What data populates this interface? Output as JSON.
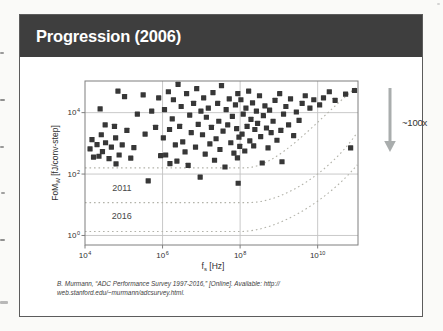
{
  "slide": {
    "title": "Progression (2006)",
    "citation": {
      "line1": "B. Murmann, “ADC Performance Survey 1997-2016,” [Online]. Available: http://",
      "line2": "web.stanford.edu/~murmann/adcsurvey.html."
    }
  },
  "colors": {
    "title_bar_bg": "#3e3e3e",
    "title_text": "#ffffff",
    "slide_border": "#5c5c5c",
    "plot_frame": "#7f7f7f",
    "gridline": "#c3c3c3",
    "scatter": "#373737",
    "trend_dotted": "#b3b3aa",
    "arrow": "#a9adad",
    "page_bg": "#fafaf8"
  },
  "chart_data": {
    "type": "scatter",
    "title": "",
    "xlabel": {
      "pre": "f",
      "sub": "s",
      "post": " [Hz]"
    },
    "ylabel": {
      "pre": "FoM",
      "sub": "W",
      "post": " [fJ/conv-step]"
    },
    "x_scale": "log",
    "y_scale": "log",
    "xlim_log10": [
      4,
      11.04
    ],
    "ylim_log10": [
      -0.31,
      5.03
    ],
    "x_tick_exponents": [
      4,
      6,
      8,
      10
    ],
    "y_tick_exponents": [
      0,
      2,
      4
    ],
    "grid": "light solid gridlines at labeled decades",
    "legend": "none",
    "arrow_label": "~100x",
    "trend_curves": [
      {
        "label": "",
        "year_implied": "2006 envelope",
        "fom_flat_log10": 2.2,
        "knee_fs_log10": 8.1,
        "c1": [
          9.0,
          2.2
        ],
        "c2": [
          10.0,
          3.8
        ],
        "end": [
          11.02,
          4.85
        ]
      },
      {
        "label": "2011",
        "fom_flat_log10": 1.07,
        "knee_fs_log10": 8.2,
        "c1": [
          9.2,
          1.07
        ],
        "c2": [
          10.4,
          2.2
        ],
        "end": [
          11.02,
          3.35
        ],
        "label_at": [
          4.95,
          1.33
        ]
      },
      {
        "label": "2016",
        "fom_flat_log10": 0.13,
        "knee_fs_log10": 8.0,
        "c1": [
          9.0,
          0.13
        ],
        "c2": [
          10.3,
          1.2
        ],
        "end": [
          11.02,
          2.3
        ],
        "label_at": [
          4.95,
          0.42
        ]
      }
    ],
    "points_log10": [
      [
        4.13,
        2.82
      ],
      [
        4.18,
        3.12
      ],
      [
        4.22,
        2.55
      ],
      [
        4.31,
        2.96
      ],
      [
        4.36,
        2.58
      ],
      [
        4.42,
        3.28
      ],
      [
        4.45,
        2.73
      ],
      [
        4.53,
        3.02
      ],
      [
        4.62,
        2.5
      ],
      [
        4.68,
        2.88
      ],
      [
        4.79,
        3.18
      ],
      [
        4.88,
        2.62
      ],
      [
        4.96,
        2.95
      ],
      [
        4.39,
        4.12
      ],
      [
        4.52,
        3.6
      ],
      [
        4.76,
        3.55
      ],
      [
        4.85,
        4.7
      ],
      [
        5.02,
        4.52
      ],
      [
        4.8,
        2.33
      ],
      [
        5.08,
        3.42
      ],
      [
        5.18,
        2.52
      ],
      [
        5.26,
        2.86
      ],
      [
        5.35,
        3.95
      ],
      [
        5.5,
        4.58
      ],
      [
        5.55,
        3.3
      ],
      [
        5.63,
        1.78
      ],
      [
        5.72,
        4.05
      ],
      [
        5.82,
        3.52
      ],
      [
        5.95,
        2.6
      ],
      [
        5.9,
        4.48
      ],
      [
        6.02,
        3.18
      ],
      [
        6.05,
        4.1
      ],
      [
        6.08,
        2.62
      ],
      [
        6.15,
        4.68
      ],
      [
        6.18,
        3.45
      ],
      [
        6.19,
        2.34
      ],
      [
        6.25,
        3.8
      ],
      [
        6.28,
        4.42
      ],
      [
        6.33,
        2.95
      ],
      [
        6.37,
        2.42
      ],
      [
        6.4,
        4.92
      ],
      [
        6.44,
        3.55
      ],
      [
        6.48,
        4.2
      ],
      [
        6.52,
        3.05
      ],
      [
        6.58,
        2.72
      ],
      [
        6.62,
        4.62
      ],
      [
        6.66,
        2.28
      ],
      [
        6.7,
        3.92
      ],
      [
        6.74,
        3.35
      ],
      [
        6.8,
        4.3
      ],
      [
        6.85,
        2.88
      ],
      [
        6.88,
        4.78
      ],
      [
        6.92,
        3.62
      ],
      [
        6.97,
        1.9
      ],
      [
        6.99,
        4.05
      ],
      [
        7.03,
        3.28
      ],
      [
        7.06,
        4.48
      ],
      [
        7.1,
        2.65
      ],
      [
        7.13,
        3.85
      ],
      [
        7.18,
        4.15
      ],
      [
        7.22,
        2.98
      ],
      [
        7.26,
        3.52
      ],
      [
        7.3,
        4.65
      ],
      [
        7.34,
        2.45
      ],
      [
        7.38,
        3.15
      ],
      [
        7.42,
        4.3
      ],
      [
        7.45,
        3.72
      ],
      [
        7.48,
        2.8
      ],
      [
        7.52,
        4.88
      ],
      [
        7.56,
        3.4
      ],
      [
        7.61,
        2.23
      ],
      [
        7.64,
        4.1
      ],
      [
        7.68,
        3.6
      ],
      [
        7.72,
        4.45
      ],
      [
        7.76,
        3.02
      ],
      [
        7.8,
        3.88
      ],
      [
        7.84,
        2.68
      ],
      [
        7.88,
        4.25
      ],
      [
        7.91,
        3.48
      ],
      [
        7.94,
        4.62
      ],
      [
        7.97,
        3.2
      ],
      [
        7.99,
        2.9
      ],
      [
        7.93,
        2.53
      ],
      [
        7.95,
        1.7
      ],
      [
        8.02,
        4.42
      ],
      [
        8.05,
        3.3
      ],
      [
        8.08,
        3.95
      ],
      [
        8.12,
        2.75
      ],
      [
        8.15,
        4.15
      ],
      [
        8.18,
        3.55
      ],
      [
        8.22,
        4.7
      ],
      [
        8.25,
        3.08
      ],
      [
        8.28,
        3.78
      ],
      [
        8.32,
        4.32
      ],
      [
        8.35,
        2.92
      ],
      [
        8.38,
        3.45
      ],
      [
        8.42,
        4.05
      ],
      [
        8.45,
        3.65
      ],
      [
        8.5,
        4.55
      ],
      [
        8.53,
        3.22
      ],
      [
        8.57,
        2.36
      ],
      [
        8.6,
        3.9
      ],
      [
        8.64,
        4.22
      ],
      [
        8.68,
        3.5
      ],
      [
        8.72,
        2.85
      ],
      [
        8.76,
        4.08
      ],
      [
        8.8,
        3.35
      ],
      [
        8.85,
        3.72
      ],
      [
        8.9,
        4.4
      ],
      [
        8.95,
        3.1
      ],
      [
        9.02,
        4.62
      ],
      [
        9.05,
        3.42
      ],
      [
        9.08,
        2.4
      ],
      [
        9.12,
        3.95
      ],
      [
        9.18,
        4.2
      ],
      [
        9.25,
        3.6
      ],
      [
        9.3,
        4.45
      ],
      [
        9.38,
        3.25
      ],
      [
        9.45,
        4.02
      ],
      [
        9.52,
        3.75
      ],
      [
        9.6,
        4.3
      ],
      [
        9.68,
        4.55
      ],
      [
        9.8,
        4.15
      ],
      [
        9.9,
        4.42
      ],
      [
        10.05,
        4.25
      ],
      [
        10.15,
        4.48
      ],
      [
        10.3,
        4.68
      ],
      [
        10.45,
        4.4
      ],
      [
        10.72,
        4.6
      ],
      [
        10.85,
        2.85
      ],
      [
        10.95,
        4.72
      ]
    ]
  }
}
